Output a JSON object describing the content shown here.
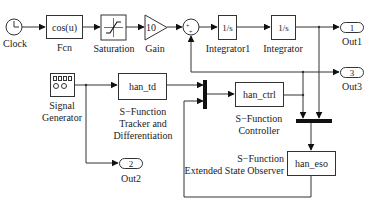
{
  "diagram": {
    "type": "simulink-block-diagram",
    "blocks": {
      "clock": {
        "label": "Clock"
      },
      "fcn": {
        "text": "cos(u)",
        "label": "Fcn"
      },
      "saturation": {
        "label": "Saturation"
      },
      "gain": {
        "text": "10",
        "label": "Gain"
      },
      "sum": {
        "signs": "++"
      },
      "integrator1": {
        "text": "1/s",
        "label": "Integrator1"
      },
      "integrator": {
        "text": "1/s",
        "label": "Integrator"
      },
      "out1": {
        "text": "1",
        "label": "Out1"
      },
      "out3": {
        "text": "3",
        "label": "Out3"
      },
      "out2": {
        "text": "2",
        "label": "Out2"
      },
      "signal_generator": {
        "label_line1": "Signal",
        "label_line2": "Generator"
      },
      "han_td": {
        "text": "han_td",
        "label_line1": "S−Function",
        "label_line2": "Tracker and",
        "label_line3": "Differentiation"
      },
      "han_ctrl": {
        "text": "han_ctrl",
        "label_line1": "S−Function",
        "label_line2": "Controller"
      },
      "han_eso": {
        "text": "han_eso",
        "label_line1": "S−Function",
        "label_line2": "Extended State Observer"
      }
    },
    "connections": [
      {
        "from": "Clock",
        "to": "Fcn"
      },
      {
        "from": "Fcn",
        "to": "Saturation"
      },
      {
        "from": "Saturation",
        "to": "Gain"
      },
      {
        "from": "Gain",
        "to": "Sum"
      },
      {
        "from": "Sum",
        "to": "Integrator1"
      },
      {
        "from": "Integrator1",
        "to": "Integrator"
      },
      {
        "from": "Integrator",
        "to": "Out1"
      },
      {
        "from": "Integrator",
        "to": "BottomMux"
      },
      {
        "from": "Signal Generator",
        "to": "han_td"
      },
      {
        "from": "Signal Generator",
        "to": "Out2"
      },
      {
        "from": "han_td",
        "to": "Mux"
      },
      {
        "from": "han_eso",
        "to": "Mux"
      },
      {
        "from": "Mux",
        "to": "han_ctrl"
      },
      {
        "from": "han_ctrl",
        "to": "Out3"
      },
      {
        "from": "han_ctrl",
        "to": "Sum"
      },
      {
        "from": "han_ctrl",
        "to": "BottomMux"
      },
      {
        "from": "BottomMux",
        "to": "han_eso"
      }
    ],
    "colors": {
      "line": "#333333",
      "background": "#ffffff"
    }
  }
}
